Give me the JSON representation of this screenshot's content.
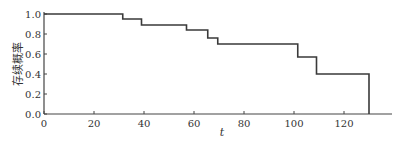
{
  "chart_data": {
    "type": "line",
    "subtype": "step",
    "title": "",
    "xlabel": "t",
    "ylabel": "存续概率",
    "xlim": [
      0,
      138
    ],
    "ylim": [
      0,
      1.0
    ],
    "x_ticks": [
      0,
      20,
      40,
      60,
      80,
      100,
      120
    ],
    "y_ticks": [
      "0.0",
      "0.2",
      "0.4",
      "0.6",
      "0.8",
      "1.0"
    ],
    "grid": false,
    "legend": null,
    "series": [
      {
        "name": "survival",
        "x": [
          0,
          31.5,
          39,
          57,
          65.5,
          69.5,
          101.5,
          109,
          130
        ],
        "y": [
          1.0,
          0.95,
          0.89,
          0.84,
          0.76,
          0.7,
          0.57,
          0.4,
          0.0
        ]
      }
    ],
    "color": "#3a3a3a"
  }
}
